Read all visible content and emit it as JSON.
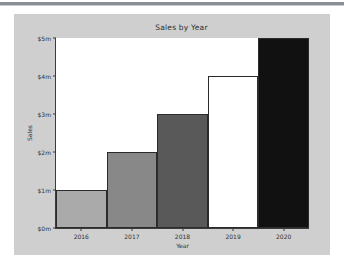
{
  "chart_data": {
    "type": "bar",
    "title": "Sales by Year",
    "xlabel": "Year",
    "ylabel": "Sales",
    "categories": [
      "2016",
      "2017",
      "2018",
      "2019",
      "2020"
    ],
    "values": [
      1,
      2,
      3,
      4,
      5
    ],
    "value_unit": "$m",
    "ylim": [
      0,
      5
    ],
    "yticks": [
      0,
      1,
      2,
      3,
      4,
      5
    ],
    "ytick_labels": [
      "$0m",
      "$1m",
      "$2m",
      "$3m",
      "$4m",
      "$5m"
    ],
    "grid": false,
    "legend": null,
    "bar_colors": [
      "#aaaaaa",
      "#888888",
      "#595959",
      "#ffffff",
      "#111111"
    ],
    "bar_edge_color": "#2b2b2b",
    "series": [
      {
        "name": "Sales",
        "values": [
          1,
          2,
          3,
          4,
          5
        ]
      }
    ]
  },
  "figure": {
    "background": "#cfcfcf",
    "axes_background": "#ffffff",
    "page_background": "#ffffff",
    "rule_color": "#8a8f95"
  }
}
